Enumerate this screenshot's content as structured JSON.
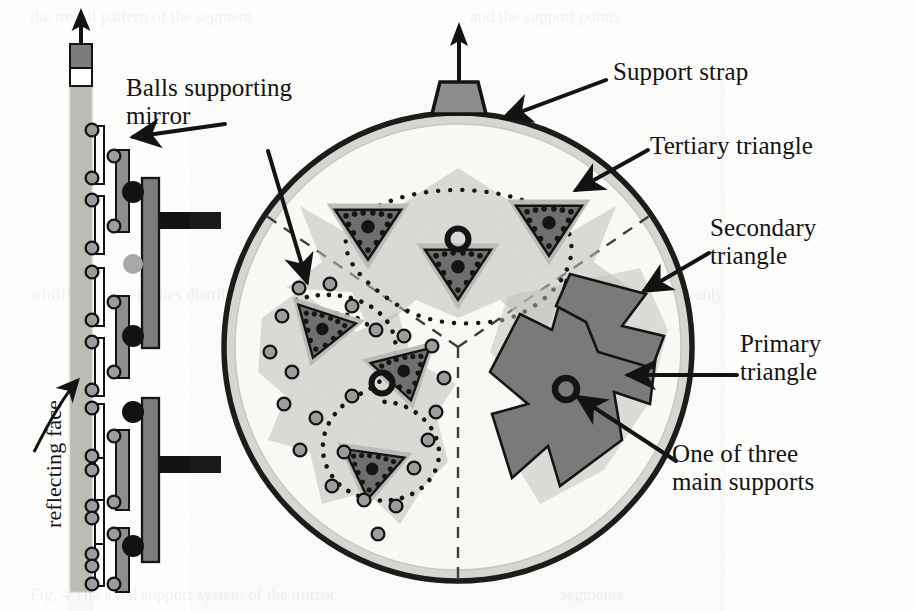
{
  "figure": {
    "type": "technical-diagram",
    "background_color": "#fdfdfb"
  },
  "labels": {
    "balls_supporting_mirror": "Balls supporting\nmirror",
    "support_strap": "Support strap",
    "tertiary_triangle": "Tertiary triangle",
    "secondary_triangle": "Secondary\ntriangle",
    "primary_triangle": "Primary\ntriangle",
    "one_of_three_main_supports": "One of three\nmain supports",
    "reflecting_face": "reflecting face"
  },
  "colors": {
    "ink": "#131313",
    "mirror_column": "#b8b8b0",
    "primary_dark": "#6f6f6f",
    "secondary_gray": "#8e8e8e",
    "tertiary_light": "#b4b4b0",
    "disc_fill": "#fbfbf8",
    "disc_rim": "#d6d6d0",
    "ball_gray": "#9a9a9a",
    "dot_dark": "#1a1a1a",
    "strap_fill": "#8d8d8d",
    "dashed_sector": "#4a4a4a"
  },
  "side_view": {
    "caption": "reflecting face",
    "mirror_column": {
      "x": 70,
      "top": 84,
      "bottom": 592,
      "width": 22
    },
    "arrow_up": {
      "from_y": 84,
      "to_y": 20
    },
    "tip_block_label": "mirror tip",
    "tertiary_bar_count": 8,
    "secondary_bar_count": 4,
    "primary_bar_count": 2,
    "ball_count": 16
  },
  "disc": {
    "center_x": 458,
    "center_y": 347,
    "radius": 234,
    "rim_width": 11,
    "sector_count": 3,
    "sector_divider_style": "dashed"
  },
  "support_strap": {
    "present": true,
    "position": "top",
    "shape": "trapezoid",
    "arrow_direction": "up"
  },
  "legend_counts": {
    "main_supports": 3,
    "primary_triangles": 3,
    "secondary_triangles": 9,
    "tertiary_triangles": 27
  }
}
